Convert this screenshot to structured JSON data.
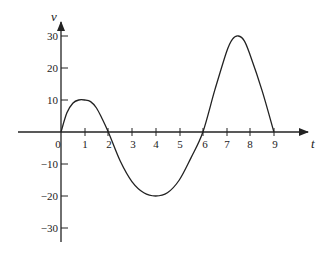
{
  "chart_data": {
    "type": "line",
    "title": "",
    "xlabel": "t",
    "ylabel": "v",
    "xlim": [
      0,
      9
    ],
    "ylim": [
      -30,
      30
    ],
    "x_ticks": [
      0,
      1,
      2,
      3,
      4,
      5,
      6,
      7,
      8,
      9
    ],
    "x_tick_labels": [
      "0",
      "1",
      "2",
      "3",
      "4",
      "5",
      "6",
      "7",
      "8",
      "9"
    ],
    "y_ticks": [
      30,
      20,
      10,
      -10,
      -20,
      -30
    ],
    "y_tick_labels": [
      "30",
      "20",
      "10",
      "−10",
      "−20",
      "−30"
    ],
    "grid": false,
    "legend": null,
    "series": [
      {
        "name": "v(t)",
        "x": [
          0,
          0.25,
          0.5,
          0.75,
          1.0,
          1.25,
          1.5,
          1.75,
          2.0,
          2.5,
          3.0,
          3.5,
          4.0,
          4.5,
          5.0,
          5.5,
          6.0,
          6.5,
          7.0,
          7.25,
          7.5,
          7.75,
          8.0,
          8.5,
          9.0
        ],
        "values": [
          0,
          6,
          9,
          10,
          10,
          9.5,
          7.5,
          4,
          0,
          -9,
          -15.5,
          -19,
          -20,
          -19,
          -15,
          -8,
          0,
          13,
          25,
          29,
          30,
          28.5,
          24,
          13,
          0
        ]
      }
    ],
    "annotations": []
  },
  "labels": {
    "y_axis": "v",
    "x_axis": "t",
    "origin": "0"
  }
}
